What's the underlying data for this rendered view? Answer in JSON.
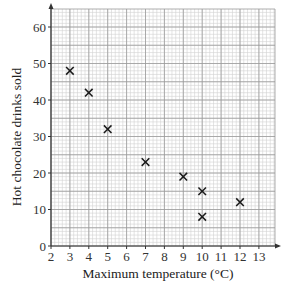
{
  "chart_data": {
    "type": "scatter",
    "title": "",
    "xlabel": "Maximum temperature (°C)",
    "ylabel": "Hot chocolate drinks sold",
    "xlim": [
      2,
      14
    ],
    "ylim": [
      0,
      65
    ],
    "xticks": [
      2,
      3,
      4,
      5,
      6,
      7,
      8,
      9,
      10,
      11,
      12,
      13
    ],
    "yticks": [
      0,
      10,
      20,
      30,
      40,
      50,
      60
    ],
    "grid": true,
    "marker": "x",
    "points": [
      {
        "x": 3,
        "y": 48
      },
      {
        "x": 4,
        "y": 42
      },
      {
        "x": 5,
        "y": 32
      },
      {
        "x": 7,
        "y": 23
      },
      {
        "x": 9,
        "y": 19
      },
      {
        "x": 10,
        "y": 15
      },
      {
        "x": 10,
        "y": 8
      },
      {
        "x": 12,
        "y": 12
      }
    ]
  },
  "colors": {
    "major_grid": "#9a9a9a",
    "minor_grid": "#d2d2d2",
    "axis": "#333333",
    "marker": "#1a1a1a"
  }
}
